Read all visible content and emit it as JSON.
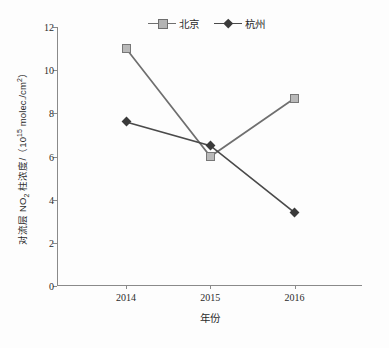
{
  "chart_data": {
    "type": "line",
    "title": "",
    "categories": [
      "2014",
      "2015",
      "2016"
    ],
    "x": [
      2014,
      2015,
      2016
    ],
    "series": [
      {
        "name": "北京",
        "values": [
          11.0,
          6.0,
          8.7
        ],
        "color": "#b9b9b9",
        "line_color": "#6f6f6f",
        "marker": "square"
      },
      {
        "name": "杭州",
        "values": [
          7.6,
          6.5,
          3.4
        ],
        "color": "#3a3a3a",
        "line_color": "#4a4a4a",
        "marker": "diamond"
      }
    ],
    "xlabel": "年份",
    "ylabel": "对流层 NO₂ 柱浓度/（10¹⁵ molec./cm²）",
    "ylabel_parts": {
      "prefix": "对流层 NO",
      "sub": "2",
      "middle": " 柱浓度/（10",
      "sup": "15",
      "suffix": " molec./cm",
      "sup2": "2",
      "end": "）"
    },
    "ylim": [
      0,
      12
    ],
    "yticks": [
      0,
      2,
      4,
      6,
      8,
      10,
      12
    ],
    "ytick_labels": [
      "0",
      "2",
      "4",
      "6",
      "8",
      "10",
      "12"
    ],
    "grid": false,
    "legend_position": "top-center",
    "legend": [
      "北京",
      "杭州"
    ]
  }
}
